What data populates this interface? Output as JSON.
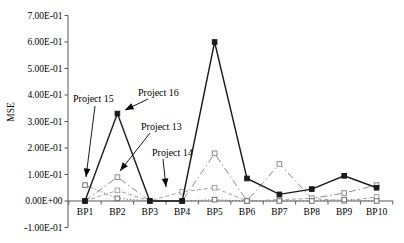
{
  "page": {
    "background": "#ffffff"
  },
  "chart_data": {
    "type": "line",
    "title": "",
    "xlabel": "",
    "ylabel": "MSE",
    "grid": false,
    "legend_position": "none-annotated-arrows",
    "categories": [
      "BP1",
      "BP2",
      "BP3",
      "BP4",
      "BP5",
      "BP6",
      "BP7",
      "BP8",
      "BP9",
      "BP10"
    ],
    "y_axis": {
      "min": -0.1,
      "max": 0.7,
      "step": 0.1,
      "tick_labels": [
        "7.00E-01",
        "6.00E-01",
        "5.00E-01",
        "4.00E-01",
        "3.00E-01",
        "2.00E-01",
        "1.00E-01",
        "0.00E+00",
        "-1.00E-01"
      ]
    },
    "series": [
      {
        "name": "Project 13",
        "line_style": "dash-dot",
        "color": "#8a8a8a",
        "marker": "open-square",
        "values": [
          0.0,
          0.09,
          0.0,
          0.0,
          0.18,
          0.0,
          0.14,
          0.01,
          0.03,
          0.06
        ]
      },
      {
        "name": "Project 14",
        "line_style": "dashed",
        "color": "#a0a0a0",
        "marker": "open-square",
        "values": [
          0.0,
          0.04,
          0.0,
          0.035,
          0.05,
          0.0,
          0.005,
          0.01,
          0.0,
          0.015
        ]
      },
      {
        "name": "Project 15",
        "line_style": "dotted",
        "color": "#6e6e6e",
        "marker": "open-square",
        "values": [
          0.06,
          0.01,
          0.0,
          0.0,
          0.005,
          0.0,
          0.0,
          0.0,
          0.005,
          0.0
        ]
      },
      {
        "name": "Project 16",
        "line_style": "solid",
        "color": "#1a1a1a",
        "marker": "filled-square",
        "values": [
          0.0,
          0.33,
          0.0,
          0.0,
          0.6,
          0.085,
          0.025,
          0.045,
          0.095,
          0.05
        ]
      }
    ],
    "annotations": [
      {
        "label": "Project 15",
        "text": {
          "x": 73,
          "y": 102
        },
        "arrow": {
          "x1": 95,
          "y1": 106,
          "x2": 86,
          "y2": 177
        }
      },
      {
        "label": "Project 16",
        "text": {
          "x": 138,
          "y": 96
        },
        "arrow": {
          "x1": 148,
          "y1": 99,
          "x2": 125,
          "y2": 110
        }
      },
      {
        "label": "Project 13",
        "text": {
          "x": 141,
          "y": 130
        },
        "arrow": {
          "x1": 150,
          "y1": 133,
          "x2": 120,
          "y2": 171
        }
      },
      {
        "label": "Project 14",
        "text": {
          "x": 152,
          "y": 156
        },
        "arrow": {
          "x1": 163,
          "y1": 159,
          "x2": 166,
          "y2": 187
        }
      }
    ],
    "layout": {
      "width": 404,
      "height": 243,
      "axis_color": "#595959",
      "axis_x": 68,
      "axis_end": 393,
      "x0": 85,
      "dx": 32.4,
      "y_zero": 201,
      "y_scale": 265,
      "y_tick_len": 3.5,
      "x_tick_len": 3.5,
      "marker_size": 4.6,
      "ylabel_pos": {
        "x": 14,
        "y": 112
      },
      "cat_label_y": 215
    }
  }
}
